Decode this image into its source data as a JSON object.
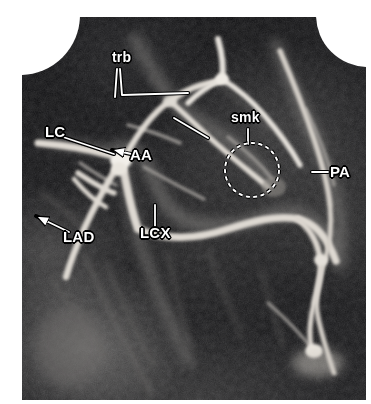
{
  "figure": {
    "kind": "coronary-angiogram",
    "modality": "x-ray coronary angiography",
    "background_color": "#ffffff",
    "film_color": "#07070a",
    "annotation_color": "#ffffff",
    "annotation_outline_color": "#000000"
  },
  "annotations": [
    {
      "id": "trb",
      "label": "trb",
      "meaning": "trabeculae",
      "label_x": 112,
      "label_y": 56,
      "leader": "two-line-bracket",
      "targets": [
        {
          "x": 120,
          "y": 117
        },
        {
          "x": 189,
          "y": 111
        }
      ]
    },
    {
      "id": "lc",
      "label": "LC",
      "meaning": "left coronary",
      "label_x": 45,
      "label_y": 131,
      "leader": "line-right",
      "targets": [
        {
          "x": 112,
          "y": 153
        }
      ]
    },
    {
      "id": "aa",
      "label": "AA",
      "meaning": "aortic arch",
      "label_x": 130,
      "label_y": 146,
      "leader": "arrow-left",
      "targets": [
        {
          "x": 110,
          "y": 152
        }
      ]
    },
    {
      "id": "smk",
      "label": "smk",
      "meaning": "smudge / marker region",
      "label_x": 231,
      "label_y": 117,
      "leader": "tick-down-to-circle",
      "targets": [
        {
          "x": 247,
          "y": 142
        }
      ],
      "marker": {
        "shape": "dashed-circle",
        "center_x": 252,
        "center_y": 170,
        "radius": 27
      }
    },
    {
      "id": "pa",
      "label": "PA",
      "meaning": "posterior artery",
      "label_x": 324,
      "label_y": 163,
      "leader": "line-left",
      "targets": [
        {
          "x": 312,
          "y": 172
        }
      ]
    },
    {
      "id": "lcx",
      "label": "LCX",
      "meaning": "left circumflex artery",
      "label_x": 140,
      "label_y": 224,
      "leader": "tick-up",
      "targets": [
        {
          "x": 155,
          "y": 205
        }
      ]
    },
    {
      "id": "lad",
      "label": "LAD",
      "meaning": "left anterior descending artery",
      "label_x": 63,
      "label_y": 228,
      "leader": "arrow-left",
      "targets": [
        {
          "x": 38,
          "y": 220
        }
      ]
    }
  ],
  "vessels": {
    "bright": "#e8e6e2",
    "mid": "#b9b6b1",
    "dim": "#86837f",
    "faint": "#58565a"
  }
}
